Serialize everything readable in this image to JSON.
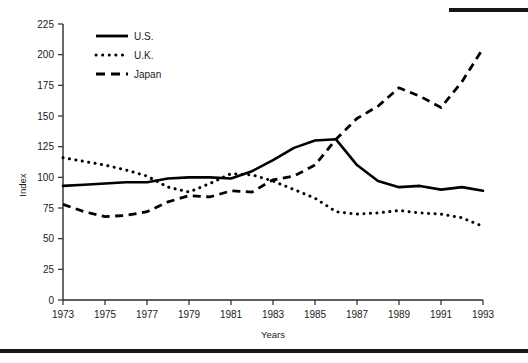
{
  "figure": {
    "top_rule": "top-right-divider",
    "bottom_rule": "bottom-divider"
  },
  "chart_data": {
    "type": "line",
    "title": "",
    "xlabel": "Years",
    "ylabel": "Index",
    "xlim": [
      1973,
      1993
    ],
    "ylim": [
      0,
      225
    ],
    "ytick_step": 25,
    "xtick_step": 2,
    "grid": false,
    "legend_position": "upper-left-inside",
    "x": [
      1973,
      1974,
      1975,
      1976,
      1977,
      1978,
      1979,
      1980,
      1981,
      1982,
      1983,
      1984,
      1985,
      1986,
      1987,
      1988,
      1989,
      1990,
      1991,
      1992,
      1993
    ],
    "xticks": [
      1973,
      1975,
      1977,
      1979,
      1981,
      1983,
      1985,
      1987,
      1989,
      1991,
      1993
    ],
    "xticklabels": [
      "1973",
      "1975",
      "1977",
      "1979",
      "1981",
      "1983",
      "1985",
      "1987",
      "1989",
      "1991",
      "1993"
    ],
    "yticks": [
      0,
      25,
      50,
      75,
      100,
      125,
      150,
      175,
      200,
      225
    ],
    "yticklabels": [
      "0",
      "25",
      "50",
      "75",
      "100",
      "125",
      "150",
      "175",
      "200",
      "225"
    ],
    "series": [
      {
        "name": "U.S.",
        "style": "solid",
        "color": "#000000",
        "values": [
          93,
          94,
          95,
          96,
          96,
          99,
          100,
          100,
          99,
          105,
          114,
          124,
          130,
          131,
          110,
          97,
          92,
          93,
          90,
          92,
          89
        ]
      },
      {
        "name": "U.K.",
        "style": "dotted",
        "color": "#000000",
        "values": [
          116,
          113,
          110,
          106,
          101,
          92,
          88,
          95,
          103,
          102,
          97,
          90,
          83,
          72,
          70,
          71,
          73,
          71,
          70,
          67,
          60
        ]
      },
      {
        "name": "Japan",
        "style": "dashed",
        "color": "#000000",
        "values": [
          78,
          72,
          68,
          69,
          72,
          80,
          85,
          84,
          89,
          88,
          98,
          101,
          110,
          131,
          148,
          158,
          173,
          166,
          157,
          178,
          205
        ]
      }
    ]
  }
}
